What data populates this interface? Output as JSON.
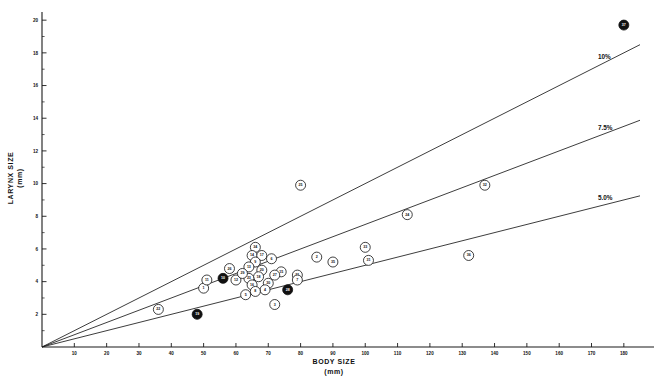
{
  "figure": {
    "background": "#ffffff",
    "ink_color": "#111111"
  },
  "chart_data": {
    "type": "scatter",
    "title": "",
    "xlabel": "BODY SIZE",
    "xlabel_unit": "(mm)",
    "ylabel": "LARYNX SIZE",
    "ylabel_unit": "(mm)",
    "xlim": [
      0,
      185
    ],
    "ylim": [
      0,
      20.5
    ],
    "grid": false,
    "legend_position": "inline-right",
    "xticks": [
      10,
      20,
      30,
      40,
      50,
      60,
      70,
      80,
      90,
      100,
      110,
      120,
      130,
      140,
      150,
      160,
      170,
      180
    ],
    "xticklabels": [
      "10",
      "20",
      "30",
      "40",
      "50",
      "60",
      "70",
      "80",
      "90",
      "100",
      "110",
      "120",
      "130",
      "140",
      "150",
      "160",
      "170",
      "180"
    ],
    "yticks": [
      2,
      4,
      6,
      8,
      10,
      12,
      14,
      16,
      18,
      20
    ],
    "yticklabels": [
      "2",
      "4",
      "6",
      "8",
      "10",
      "12",
      "14",
      "16",
      "18",
      "20"
    ],
    "y_minor_step": 1,
    "reference_lines": [
      {
        "label": "10%",
        "slope": 0.1,
        "label_x": 172,
        "label_y": 17.6
      },
      {
        "label": "7.5%",
        "slope": 0.075,
        "label_x": 172,
        "label_y": 13.3
      },
      {
        "label": "5.0%",
        "slope": 0.05,
        "label_x": 172,
        "label_y": 9.0
      }
    ],
    "point_style": {
      "marker": "numbered-circle",
      "radius_px": 5.0,
      "fill": "#ffffff",
      "edge": "#111111"
    },
    "points": [
      {
        "id": "22",
        "x": 36,
        "y": 2.3,
        "filled": false
      },
      {
        "id": "19",
        "x": 48,
        "y": 2.0,
        "filled": true
      },
      {
        "id": "1",
        "x": 50,
        "y": 3.6,
        "filled": false
      },
      {
        "id": "11",
        "x": 51,
        "y": 4.1,
        "filled": false
      },
      {
        "id": "10",
        "x": 56,
        "y": 4.2,
        "filled": true
      },
      {
        "id": "12",
        "x": 60,
        "y": 4.1,
        "filled": false
      },
      {
        "id": "34",
        "x": 66,
        "y": 6.1,
        "filled": false
      },
      {
        "id": "14",
        "x": 65,
        "y": 5.6,
        "filled": false
      },
      {
        "id": "17",
        "x": 68,
        "y": 5.6,
        "filled": false
      },
      {
        "id": "9",
        "x": 66,
        "y": 5.2,
        "filled": false
      },
      {
        "id": "6",
        "x": 71,
        "y": 5.4,
        "filled": false
      },
      {
        "id": "13",
        "x": 64,
        "y": 4.9,
        "filled": false
      },
      {
        "id": "20",
        "x": 68,
        "y": 4.7,
        "filled": false
      },
      {
        "id": "15",
        "x": 74,
        "y": 4.6,
        "filled": false
      },
      {
        "id": "27",
        "x": 72,
        "y": 4.4,
        "filled": false
      },
      {
        "id": "18",
        "x": 67,
        "y": 4.3,
        "filled": false
      },
      {
        "id": "23",
        "x": 64,
        "y": 4.2,
        "filled": false
      },
      {
        "id": "30",
        "x": 70,
        "y": 3.9,
        "filled": false
      },
      {
        "id": "16",
        "x": 65,
        "y": 3.8,
        "filled": false
      },
      {
        "id": "4",
        "x": 69,
        "y": 3.5,
        "filled": false
      },
      {
        "id": "8",
        "x": 66,
        "y": 3.4,
        "filled": false
      },
      {
        "id": "5",
        "x": 63,
        "y": 3.2,
        "filled": false
      },
      {
        "id": "29",
        "x": 62,
        "y": 4.5,
        "filled": false
      },
      {
        "id": "26",
        "x": 58,
        "y": 4.8,
        "filled": false
      },
      {
        "id": "21",
        "x": 79,
        "y": 4.4,
        "filled": false
      },
      {
        "id": "7",
        "x": 79,
        "y": 4.1,
        "filled": false
      },
      {
        "id": "28",
        "x": 76,
        "y": 3.5,
        "filled": true
      },
      {
        "id": "3",
        "x": 72,
        "y": 2.6,
        "filled": false
      },
      {
        "id": "2",
        "x": 85,
        "y": 5.5,
        "filled": false
      },
      {
        "id": "35",
        "x": 90,
        "y": 5.2,
        "filled": false
      },
      {
        "id": "25",
        "x": 80,
        "y": 9.9,
        "filled": false
      },
      {
        "id": "33",
        "x": 100,
        "y": 6.1,
        "filled": false
      },
      {
        "id": "31",
        "x": 101,
        "y": 5.3,
        "filled": false
      },
      {
        "id": "24",
        "x": 113,
        "y": 8.1,
        "filled": false
      },
      {
        "id": "32",
        "x": 137,
        "y": 9.9,
        "filled": false
      },
      {
        "id": "36",
        "x": 132,
        "y": 5.6,
        "filled": false
      },
      {
        "id": "37",
        "x": 180,
        "y": 19.7,
        "filled": true
      }
    ]
  }
}
